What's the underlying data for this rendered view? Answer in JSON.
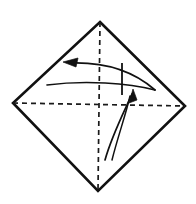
{
  "figure": {
    "canvas": {
      "width": 196,
      "height": 204,
      "background": "#ffffff"
    },
    "colors": {
      "outline": "#111111",
      "crease": "#1a1a1a",
      "arrow": "#111111",
      "background": "#ffffff"
    }
  },
  "shape": {
    "name": "diamond-square",
    "vertices": {
      "top": {
        "x": 100,
        "y": 22
      },
      "right": {
        "x": 185,
        "y": 106
      },
      "bottom": {
        "x": 98,
        "y": 191
      },
      "left": {
        "x": 13,
        "y": 103
      }
    },
    "outline_points": "100,22 185,106 98,191 13,103",
    "stroke_width": 2.6
  },
  "creases": [
    {
      "name": "vertical-crease",
      "style": "dashed",
      "x1": 100,
      "y1": 22,
      "x2": 98,
      "y2": 191,
      "dash": "5,4"
    },
    {
      "name": "horizontal-crease",
      "style": "dashed",
      "x1": 13,
      "y1": 103,
      "x2": 185,
      "y2": 106,
      "dash": "5,4"
    }
  ],
  "annotations": [
    {
      "name": "left-fold-arrow",
      "type": "curved-arrow",
      "direction": "left",
      "path": "M 155,90 C 130,68 100,62 70,63",
      "head_at": {
        "x": 63,
        "y": 62
      },
      "head_points": "63,62 78,58 76,67"
    },
    {
      "name": "lower-sweep-curve",
      "type": "curve",
      "direction": "right",
      "path": "M 47,85 C 85,80 128,83 155,90"
    },
    {
      "name": "vertical-tick-mark",
      "type": "tick",
      "x1": 122,
      "y1": 63,
      "x2": 122,
      "y2": 95
    },
    {
      "name": "up-fold-arrow",
      "type": "curved-arrow",
      "direction": "up",
      "path": "M 105,160 C 112,135 124,112 132,94",
      "head_at": {
        "x": 133,
        "y": 89
      },
      "head_points": "133,89 129,103 137,100"
    },
    {
      "name": "up-fold-arrow-inner",
      "type": "curve",
      "direction": "up",
      "path": "M 112,160 C 118,136 126,114 130,96"
    }
  ]
}
